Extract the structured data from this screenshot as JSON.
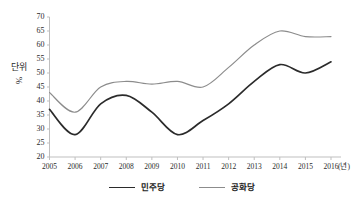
{
  "chart_data": {
    "type": "line",
    "title": "",
    "xlabel": "(년)",
    "ylabel": "단위 %",
    "ylabel_parts": {
      "unit_word": "단위",
      "percent": "%"
    },
    "x": [
      2005,
      2006,
      2007,
      2008,
      2009,
      2010,
      2011,
      2012,
      2013,
      2014,
      2015,
      2016
    ],
    "categories": [
      "2005",
      "2006",
      "2007",
      "2008",
      "2009",
      "2010",
      "2011",
      "2012",
      "2013",
      "2014",
      "2015",
      "2016"
    ],
    "xlim": [
      2005,
      2016
    ],
    "ylim": [
      20,
      70
    ],
    "yticks": [
      20,
      25,
      30,
      35,
      40,
      45,
      50,
      55,
      60,
      65,
      70
    ],
    "ytick_labels": [
      "20",
      "25",
      "30",
      "35",
      "40",
      "45",
      "50",
      "55",
      "60",
      "65",
      "70"
    ],
    "grid": false,
    "legend_position": "bottom",
    "series": [
      {
        "name": "민주당",
        "color": "#2b2b2b",
        "values": [
          37,
          28,
          39,
          42,
          36,
          28,
          33,
          39,
          47,
          53,
          50,
          54
        ]
      },
      {
        "name": "공화당",
        "color": "#8c8c8c",
        "values": [
          43,
          36,
          45,
          47,
          46,
          47,
          45,
          52,
          60,
          65,
          63,
          63
        ]
      }
    ]
  },
  "axis": {
    "y_unit_line1": "단위",
    "y_unit_line2": "%",
    "x_unit": "(년)"
  },
  "colors": {
    "series_democratic": "#2b2b2b",
    "series_republican": "#8c8c8c",
    "axis": "#bfbfbf",
    "text": "#2b2b2b",
    "background": "#ffffff"
  }
}
